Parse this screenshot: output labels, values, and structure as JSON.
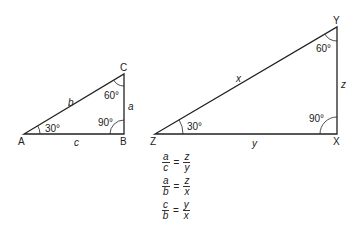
{
  "diagram": {
    "triangle1": {
      "vertices": {
        "A": "A",
        "B": "B",
        "C": "C"
      },
      "sides": {
        "a": "a",
        "b": "b",
        "c": "c"
      },
      "angles": {
        "A": "30°",
        "B": "90°",
        "C": "60°"
      }
    },
    "triangle2": {
      "vertices": {
        "Z": "Z",
        "X": "X",
        "Y": "Y"
      },
      "sides": {
        "x": "x",
        "y": "y",
        "z": "z"
      },
      "angles": {
        "Z": "30°",
        "X": "90°",
        "Y": "60°"
      }
    },
    "equations": [
      {
        "num1": "a",
        "den1": "c",
        "eq": "=",
        "num2": "z",
        "den2": "y"
      },
      {
        "num1": "a",
        "den1": "b",
        "eq": "=",
        "num2": "z",
        "den2": "x"
      },
      {
        "num1": "c",
        "den1": "b",
        "eq": "=",
        "num2": "y",
        "den2": "x"
      }
    ]
  }
}
